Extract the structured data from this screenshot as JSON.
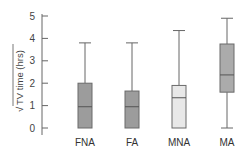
{
  "chart_data": {
    "type": "box",
    "title": "",
    "xlabel": "",
    "ylabel": "√TV time (hrs)",
    "ylim": [
      0,
      5
    ],
    "yticks": [
      0,
      1,
      2,
      3,
      4,
      5
    ],
    "grid": false,
    "legend": null,
    "categories": [
      "FNA",
      "FA",
      "MNA",
      "MA"
    ],
    "series": [
      {
        "name": "FNA",
        "whisker_low": 0.0,
        "q1": 0.0,
        "median": 0.95,
        "q3": 2.0,
        "whisker_high": 3.8,
        "fill": "#9c9c9c"
      },
      {
        "name": "FA",
        "whisker_low": 0.0,
        "q1": 0.0,
        "median": 0.95,
        "q3": 1.65,
        "whisker_high": 3.8,
        "fill": "#9c9c9c"
      },
      {
        "name": "MNA",
        "whisker_low": 0.0,
        "q1": 0.0,
        "median": 1.35,
        "q3": 1.9,
        "whisker_high": 4.35,
        "fill": "#e8e8e8"
      },
      {
        "name": "MA",
        "whisker_low": 0.0,
        "q1": 1.6,
        "median": 2.37,
        "q3": 3.75,
        "whisker_high": 4.9,
        "fill": "#ababab"
      }
    ]
  },
  "axis": {
    "ylabel_radical": "√",
    "ylabel_text": "TV time (hrs)"
  }
}
